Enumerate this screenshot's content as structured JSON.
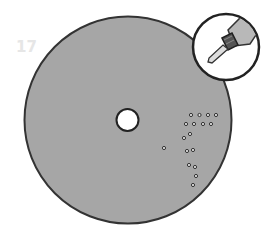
{
  "step": {
    "number": "17"
  },
  "illustration": {
    "disc": {
      "cx": 128,
      "cy": 120,
      "r": 104,
      "fill": "#a6a6a6",
      "stroke": "#333333"
    },
    "center_hole": {
      "cx": 127,
      "cy": 120,
      "r": 11,
      "fill": "#ffffff",
      "stroke": "#222222"
    },
    "drilled_holes": [
      [
        191,
        115
      ],
      [
        199.5,
        115
      ],
      [
        208,
        115
      ],
      [
        216,
        115
      ],
      [
        186,
        124
      ],
      [
        194,
        124
      ],
      [
        203,
        124
      ],
      [
        211,
        124
      ],
      [
        190,
        134
      ],
      [
        184,
        138
      ],
      [
        164,
        148
      ],
      [
        187,
        151
      ],
      [
        193,
        150
      ],
      [
        189,
        165
      ],
      [
        195,
        167
      ],
      [
        196,
        176
      ],
      [
        193,
        185
      ]
    ],
    "inset": {
      "cx": 226,
      "cy": 47,
      "r": 33,
      "icon": "drill-bit-icon"
    },
    "colors": {
      "background": "#ffffff",
      "disc": "#a6a6a6",
      "outline": "#333333",
      "step_number": "#e6e6e6"
    }
  }
}
